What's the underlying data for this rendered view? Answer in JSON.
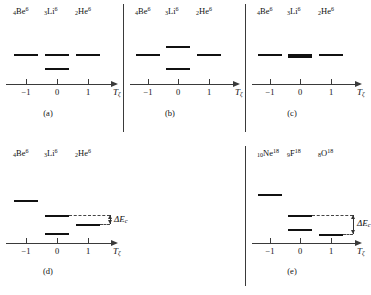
{
  "figure": {
    "axis_label": "T",
    "axis_label_sub": "ζ",
    "ticks": [
      "−1",
      "0",
      "1"
    ],
    "delta_label": "ΔE",
    "delta_label_sub": "c"
  },
  "panels": [
    {
      "id": "a",
      "caption": "(a)",
      "nuclides": [
        {
          "z": "4",
          "symbol": "Be",
          "a": "6"
        },
        {
          "z": "3",
          "symbol": "Li",
          "a": "6"
        },
        {
          "z": "2",
          "symbol": "He",
          "a": "6"
        }
      ],
      "levels": [
        {
          "column": 0,
          "height": 1.0,
          "style": "normal"
        },
        {
          "column": 1,
          "height": 1.0,
          "style": "normal"
        },
        {
          "column": 2,
          "height": 1.0,
          "style": "normal"
        },
        {
          "column": 1,
          "height": 0.55,
          "style": "normal"
        }
      ],
      "has_delta": false
    },
    {
      "id": "b",
      "caption": "(b)",
      "nuclides": [
        {
          "z": "4",
          "symbol": "Be",
          "a": "6"
        },
        {
          "z": "3",
          "symbol": "Li",
          "a": "6"
        },
        {
          "z": "2",
          "symbol": "He",
          "a": "6"
        }
      ],
      "levels": [
        {
          "column": 0,
          "height": 1.0,
          "style": "normal"
        },
        {
          "column": 1,
          "height": 1.28,
          "style": "normal"
        },
        {
          "column": 2,
          "height": 1.0,
          "style": "normal"
        },
        {
          "column": 1,
          "height": 0.55,
          "style": "normal"
        }
      ],
      "has_delta": false
    },
    {
      "id": "c",
      "caption": "(c)",
      "nuclides": [
        {
          "z": "4",
          "symbol": "Be",
          "a": "6"
        },
        {
          "z": "3",
          "symbol": "Li",
          "a": "6"
        },
        {
          "z": "2",
          "symbol": "He",
          "a": "6"
        }
      ],
      "levels": [
        {
          "column": 0,
          "height": 1.0,
          "style": "normal"
        },
        {
          "column": 1,
          "height": 1.0,
          "style": "thick"
        },
        {
          "column": 2,
          "height": 1.0,
          "style": "normal"
        }
      ],
      "has_delta": false
    },
    {
      "id": "d",
      "caption": "(d)",
      "nuclides": [
        {
          "z": "4",
          "symbol": "Be",
          "a": "6"
        },
        {
          "z": "3",
          "symbol": "Li",
          "a": "6"
        },
        {
          "z": "2",
          "symbol": "He",
          "a": "6"
        }
      ],
      "levels": [
        {
          "column": 0,
          "height": 1.42,
          "style": "normal"
        },
        {
          "column": 1,
          "height": 0.92,
          "style": "normal"
        },
        {
          "column": 2,
          "height": 0.62,
          "style": "normal"
        },
        {
          "column": 1,
          "height": 0.32,
          "style": "normal"
        }
      ],
      "has_delta": true,
      "delta_top": 0.92,
      "delta_bottom": 0.62
    },
    {
      "id": "e",
      "caption": "(e)",
      "nuclides": [
        {
          "z": "10",
          "symbol": "Ne",
          "a": "18"
        },
        {
          "z": "9",
          "symbol": "F",
          "a": "18"
        },
        {
          "z": "8",
          "symbol": "O",
          "a": "18"
        }
      ],
      "levels": [
        {
          "column": 0,
          "height": 1.62,
          "style": "normal"
        },
        {
          "column": 1,
          "height": 0.95,
          "style": "normal"
        },
        {
          "column": 2,
          "height": 0.3,
          "style": "normal"
        },
        {
          "column": 1,
          "height": 0.48,
          "style": "normal"
        }
      ],
      "has_delta": true,
      "delta_top": 0.95,
      "delta_bottom": 0.3
    }
  ]
}
